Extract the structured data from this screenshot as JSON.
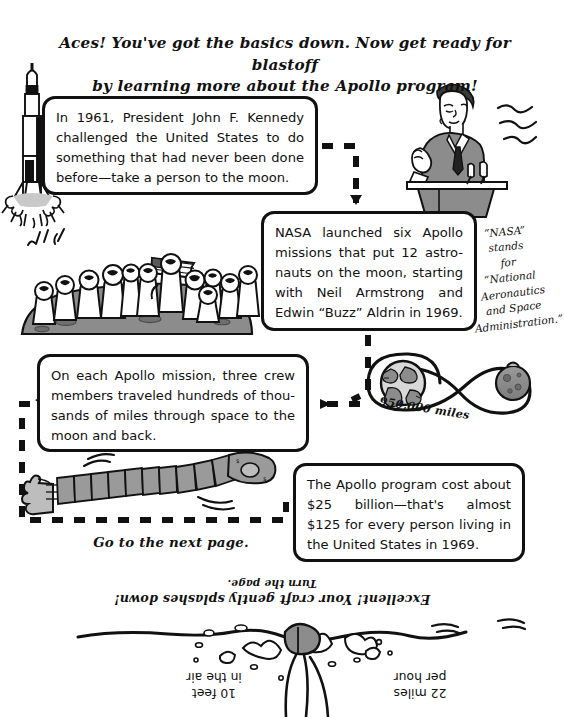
{
  "page": {
    "width": 544,
    "height": 717,
    "background": "#ffffff",
    "ink": "#111111",
    "gray_fill": "#8c8c8c",
    "light_gray": "#c9c9c9"
  },
  "headline": {
    "line1": "Aces! You've got the basics down. Now get ready for blastoff",
    "line2": "by learning more about the Apollo program!"
  },
  "boxes": [
    {
      "id": "box-kennedy",
      "text": "In 1961, President John F. Kennedy challenged the United States to do something that had never been done before—take a person to the moon."
    },
    {
      "id": "box-nasa-missions",
      "text": "NASA launched six Apollo missions that put 12 astro-nauts on the moon, starting with Neil Armstrong and Edwin “Buzz” Aldrin in 1969."
    },
    {
      "id": "box-crew",
      "text": "On each Apollo mission, three crew members traveled hundreds of thou-sands of miles through space to the moon and back."
    },
    {
      "id": "box-cost",
      "text": "The Apollo program cost about $25 billion—that's almost $125 for every person living in the United States in 1969."
    }
  ],
  "notes": {
    "nasa_acronym": {
      "line1": "“NASA” stands",
      "line2": "for “National",
      "line3": "Aeronautics",
      "line4": "and Space",
      "line5": "Administration.”"
    },
    "distance_label": "950,000 miles",
    "next_page": "Go to the next page."
  },
  "bottom_section": {
    "splash_line_top": "Turn the page.",
    "splash_line_main": "Excellent! Your craft gently splashes down!",
    "label_left": {
      "line1": "10 feet",
      "line2": "in the air"
    },
    "label_right": {
      "line1": "22 miles",
      "line2": "per hour"
    },
    "orientation": "upside-down"
  },
  "illustrations": [
    {
      "name": "saturn-v-rocket-launching",
      "label": "rocket"
    },
    {
      "name": "jfk-at-podium",
      "label": "John F. Kennedy giving a speech"
    },
    {
      "name": "twelve-astronauts-on-moon-with-flag",
      "label": "astronauts and US flag"
    },
    {
      "name": "hand-holding-strip-of-dollar-bills",
      "label": "money"
    },
    {
      "name": "earth-moon-figure-eight-orbit",
      "label": "Earth and Moon loop"
    },
    {
      "name": "capsule-splashdown-in-ocean",
      "label": "splashdown"
    }
  ]
}
